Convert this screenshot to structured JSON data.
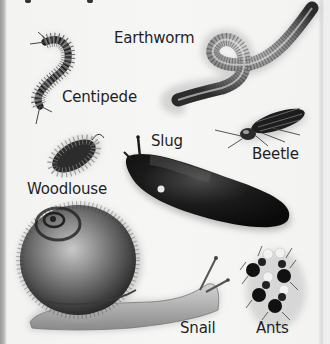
{
  "title_fragment": "",
  "creatures": [
    {
      "id": "earthworm",
      "label": "Earthworm"
    },
    {
      "id": "centipede",
      "label": "Centipede"
    },
    {
      "id": "slug",
      "label": "Slug"
    },
    {
      "id": "beetle",
      "label": "Beetle"
    },
    {
      "id": "woodlouse",
      "label": "Woodlouse"
    },
    {
      "id": "snail",
      "label": "Snail"
    },
    {
      "id": "ants",
      "label": "Ants"
    }
  ],
  "colors": {
    "background": "#f4f4f3",
    "label_text": "#1f1f1f",
    "dark_body": "#141414",
    "worm_grey": "#6e6e6e"
  }
}
